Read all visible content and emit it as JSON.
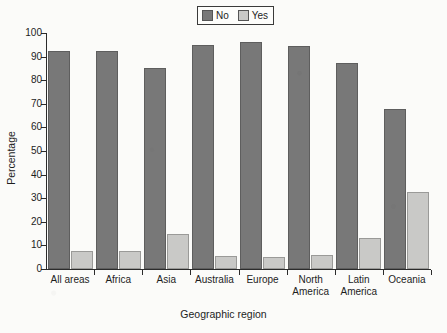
{
  "chart_data": {
    "type": "bar",
    "title": "",
    "xlabel": "Geographic region",
    "ylabel": "Percentage",
    "ylim": [
      0,
      100
    ],
    "ytick_step": 10,
    "yticks": [
      0,
      10,
      20,
      30,
      40,
      50,
      60,
      70,
      80,
      90,
      100
    ],
    "grid": false,
    "legend_position": "top-center",
    "categories": [
      "All areas",
      "Africa",
      "Asia",
      "Australia",
      "Europe",
      "North\nAmerica",
      "Latin\nAmerica",
      "Oceania"
    ],
    "series": [
      {
        "name": "No",
        "color": "#787878",
        "values": [
          92.5,
          92.5,
          85.0,
          95.0,
          96.0,
          94.5,
          87.5,
          68.0
        ]
      },
      {
        "name": "Yes",
        "color": "#c9c9c7",
        "values": [
          7.5,
          7.5,
          15.0,
          5.5,
          5.0,
          6.0,
          13.0,
          32.5
        ]
      }
    ]
  },
  "legend": {
    "items": [
      {
        "label": "No",
        "color": "#787878"
      },
      {
        "label": "Yes",
        "color": "#c9c9c7"
      }
    ]
  },
  "axes": {
    "y_title": "Percentage",
    "x_title": "Geographic region",
    "y_tick_labels": [
      "0",
      "10",
      "20",
      "30",
      "40",
      "50",
      "60",
      "70",
      "80",
      "90",
      "100"
    ]
  }
}
